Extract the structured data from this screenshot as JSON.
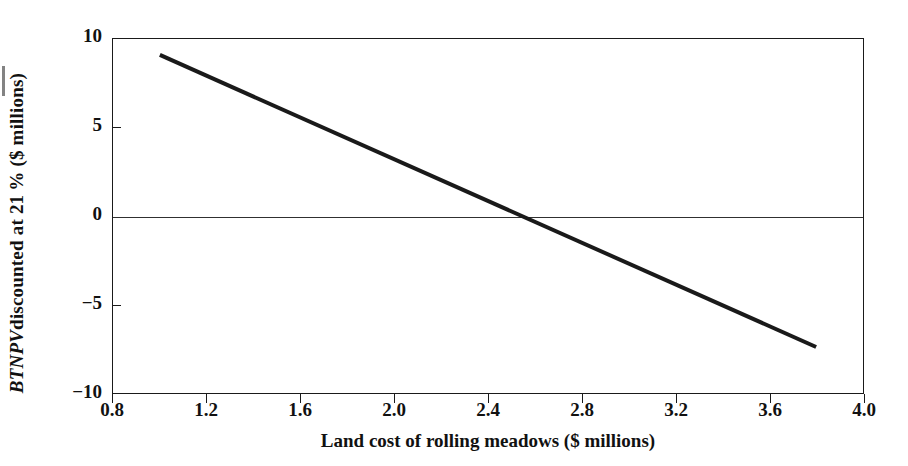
{
  "chart_data": {
    "type": "line",
    "title": "",
    "xlabel": "Land cost of rolling meadows ($ millions)",
    "ylabel_parts": {
      "italic": "BTNPV",
      "rest": " discounted at 21 % ($ millions)"
    },
    "ylabel": "BTNPV discounted at 21 % ($ millions)",
    "xlim": [
      0.8,
      4.0
    ],
    "ylim": [
      -10,
      10
    ],
    "xticks": [
      0.8,
      1.2,
      1.6,
      2.0,
      2.4,
      2.8,
      3.2,
      3.6,
      4.0
    ],
    "xticklabels": [
      "0.8",
      "1.2",
      "1.6",
      "2.0",
      "2.4",
      "2.8",
      "3.2",
      "3.6",
      "4.0"
    ],
    "yticks": [
      10,
      5,
      0,
      -5,
      -10
    ],
    "yticklabels": [
      "10",
      "5",
      "0",
      "−15",
      "−10"
    ],
    "ytick_display": [
      "10",
      "5",
      "0",
      "−5",
      "−10"
    ],
    "grid": false,
    "legend": null,
    "zero_line": 0,
    "series": [
      {
        "name": "BTNPV at 21%",
        "color": "#1a1a1a",
        "linewidth": 4,
        "x": [
          1.0,
          3.8
        ],
        "y": [
          9.1,
          -7.4
        ],
        "x_intercept": 2.55,
        "slope": -5.89
      }
    ],
    "annotations": []
  },
  "figure": {
    "background": "#ffffff",
    "frame_color": "#1a1a1a",
    "text_color": "#111111"
  }
}
